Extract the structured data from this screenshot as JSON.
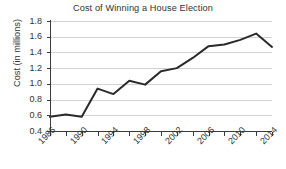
{
  "chart_data": {
    "type": "line",
    "title": "Cost of Winning a House Election",
    "xlabel": "",
    "ylabel": "Cost (in millions)",
    "ylim": [
      0.4,
      1.8
    ],
    "xlim": [
      1986,
      2014
    ],
    "ytick_labels": [
      "1.8",
      "1.6",
      "1.4",
      "1.2",
      "1.0",
      "0.8",
      "0.6",
      "0.4"
    ],
    "ytick_values": [
      1.8,
      1.6,
      1.4,
      1.2,
      1.0,
      0.8,
      0.6,
      0.4
    ],
    "xtick_labels": [
      "1986",
      "1990",
      "1994",
      "1998",
      "2002",
      "2006",
      "2010",
      "2014"
    ],
    "xtick_values": [
      1986,
      1990,
      1994,
      1998,
      2002,
      2006,
      2010,
      2014
    ],
    "xtick_minor_values": [
      1988,
      1992,
      1996,
      2000,
      2004,
      2008,
      2012
    ],
    "grid": "horizontal",
    "legend": "none",
    "line_color": "#2a2a2a",
    "grid_color": "#d2d2d2",
    "axis_color": "#3b3b3b",
    "x": [
      1986,
      1988,
      1990,
      1992,
      1994,
      1996,
      1998,
      2000,
      2002,
      2004,
      2006,
      2008,
      2010,
      2012,
      2014
    ],
    "values": [
      0.58,
      0.61,
      0.58,
      0.94,
      0.87,
      1.04,
      0.99,
      1.16,
      1.2,
      1.33,
      1.48,
      1.5,
      1.56,
      1.64,
      1.47
    ],
    "series": [
      {
        "name": "Cost of winning a House election",
        "values": [
          0.58,
          0.61,
          0.58,
          0.94,
          0.87,
          1.04,
          0.99,
          1.16,
          1.2,
          1.33,
          1.48,
          1.5,
          1.56,
          1.64,
          1.47
        ]
      }
    ]
  }
}
